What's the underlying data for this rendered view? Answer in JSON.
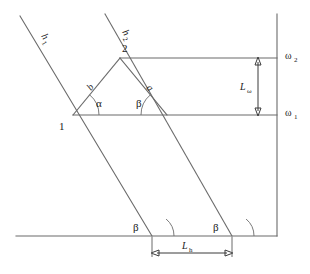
{
  "figure": {
    "type": "geometry-diagram",
    "background_color": "#ffffff",
    "line_color": "#6b6b6b",
    "dimension_color": "#3a3a3a",
    "text_color": "#1a1a1a"
  },
  "labels": {
    "h1": "h",
    "h1_sub": "1",
    "h2": "h",
    "h2_sub": "2",
    "point_1": "1",
    "point_2": "2",
    "side_a": "a",
    "side_b": "b",
    "angle_alpha": "α",
    "angle_beta_triangle": "β",
    "angle_beta_left": "β",
    "angle_beta_right": "β",
    "omega_1": "ω",
    "omega_1_sub": "1",
    "omega_2": "ω",
    "omega_2_sub": "2",
    "dim_l_omega": "L",
    "dim_l_omega_sub": "ω",
    "dim_l_h": "L",
    "dim_l_h_sub": "h"
  },
  "geometry": {
    "vertex_1": {
      "x": 73,
      "y": 115
    },
    "vertex_2": {
      "x": 120,
      "y": 58
    },
    "vertex_3": {
      "x": 167,
      "y": 115
    },
    "axis_x": 277,
    "level_omega_2_y": 58,
    "level_omega_1_y": 115,
    "baseline_y": 236,
    "beta_left_x": 152,
    "beta_right_x": 232,
    "h1_start": {
      "x": 20,
      "y": 16
    },
    "h2_start": {
      "x": 105,
      "y": 14
    },
    "dim_l_h_y": 253,
    "dim_l_omega_x": 258,
    "angle_alpha_deg": 50,
    "angle_beta_deg": 50
  }
}
